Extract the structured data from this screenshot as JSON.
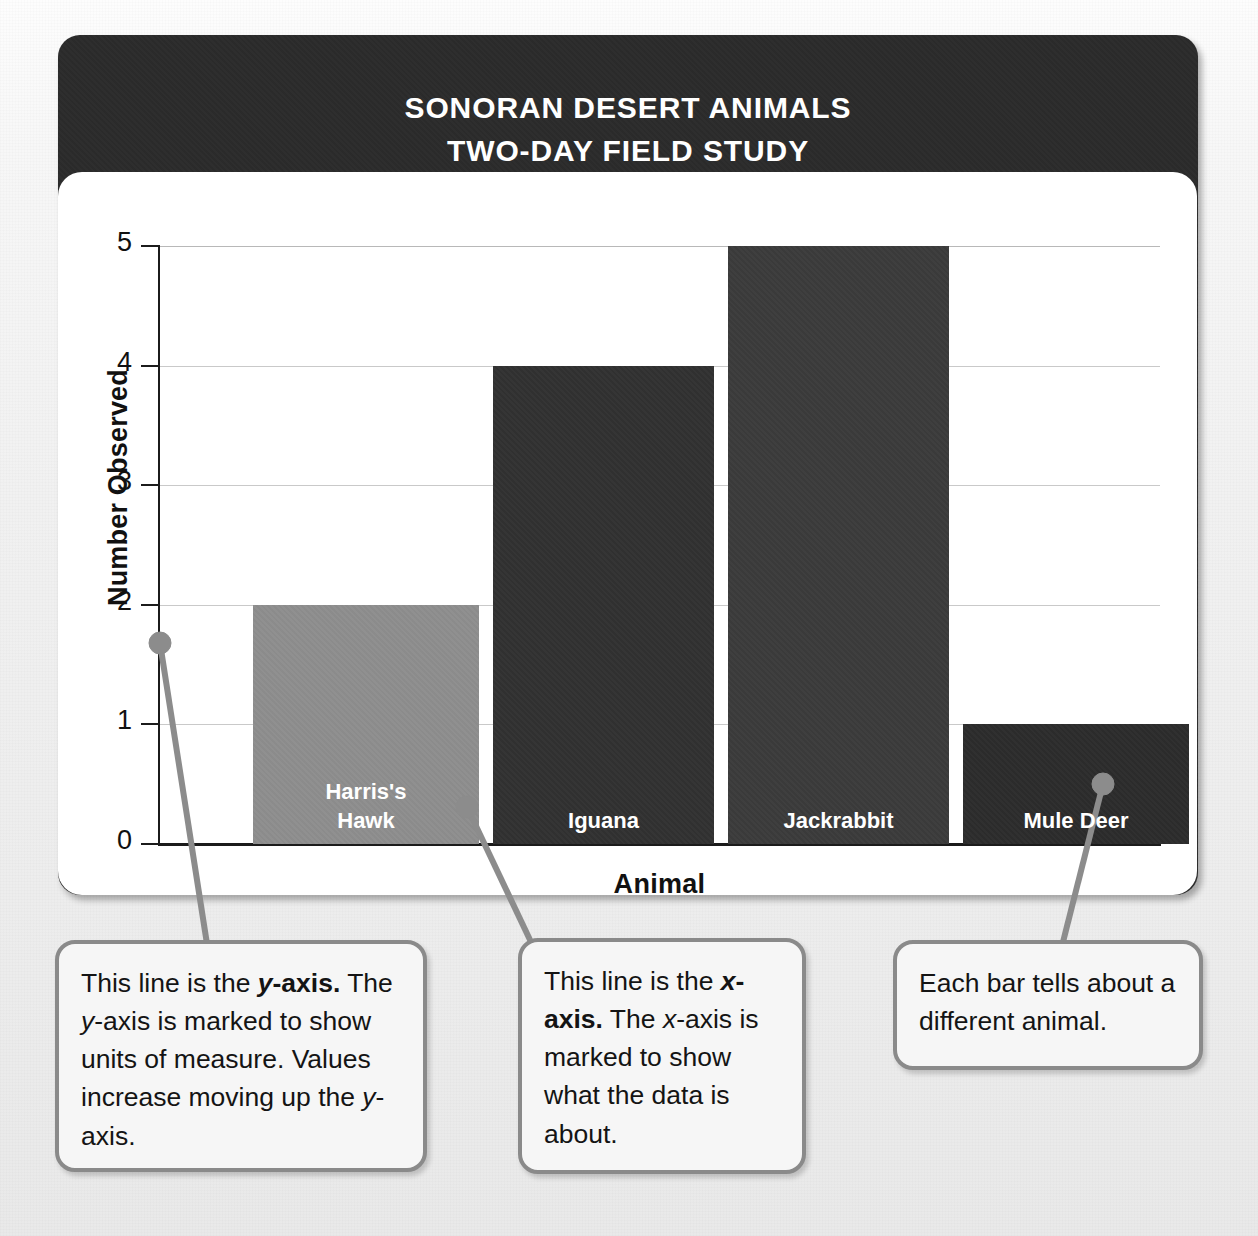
{
  "page": {
    "cutoff_text_above_graph": "information.",
    "background_color": "#eeeeee"
  },
  "graph_card": {
    "title": "SONORAN DESERT ANIMALS\nTWO-DAY FIELD STUDY",
    "header_color": "#2b2b2b",
    "panel_color": "#ffffff"
  },
  "chart_data": {
    "type": "bar",
    "title": "SONORAN DESERT ANIMALS TWO-DAY FIELD STUDY",
    "xlabel": "Animal",
    "ylabel": "Number Observed",
    "categories": [
      "Harris's Hawk",
      "Iguana",
      "Jackrabbit",
      "Mule Deer"
    ],
    "values": [
      2,
      4,
      5,
      1
    ],
    "ylim": [
      0,
      5
    ],
    "yticks": [
      0,
      1,
      2,
      3,
      4,
      5
    ],
    "ytick_labels": [
      "0",
      "1",
      "2",
      "3",
      "4",
      "5"
    ],
    "grid": true,
    "grid_axis": "y",
    "legend": false,
    "bar_labels_inside": true,
    "bar_label_lines": [
      [
        "Harris's",
        "Hawk"
      ],
      [
        "Iguana"
      ],
      [
        "Jackrabbit"
      ],
      [
        "Mule Deer"
      ]
    ],
    "bar_colors": [
      "#8e8e8e",
      "#313131",
      "#3b3b3b",
      "#2c2c2c"
    ],
    "bar_label_color": "#ffffff"
  },
  "callouts": [
    {
      "id": "y-axis-callout",
      "target": "y-axis",
      "segments": [
        {
          "text": "This line is the ",
          "style": "normal"
        },
        {
          "text": "y-axis.",
          "style": "bold-italic-y"
        },
        {
          "text": " The ",
          "style": "normal"
        },
        {
          "text": "y",
          "style": "italic"
        },
        {
          "text": "-axis is marked to show units of measure. Values increase moving up the ",
          "style": "normal"
        },
        {
          "text": "y",
          "style": "italic"
        },
        {
          "text": "-axis.",
          "style": "normal"
        }
      ],
      "plain_text": "This line is the y-axis. The y-axis is marked to show units of measure. Values increase moving up the y-axis."
    },
    {
      "id": "x-axis-callout",
      "target": "x-axis",
      "segments": [
        {
          "text": "This line is the ",
          "style": "normal"
        },
        {
          "text": "x-axis.",
          "style": "bold-italic-x"
        },
        {
          "text": " The ",
          "style": "normal"
        },
        {
          "text": "x",
          "style": "italic"
        },
        {
          "text": "-axis is marked to show what the data is about.",
          "style": "normal"
        }
      ],
      "plain_text": "This line is the x-axis. The x-axis is marked to show what the data is about."
    },
    {
      "id": "bars-callout",
      "target": "bars",
      "segments": [
        {
          "text": "Each bar tells about a different animal.",
          "style": "normal"
        }
      ],
      "plain_text": "Each bar tells about a different animal."
    }
  ],
  "connector_color": "#8c8c8c"
}
